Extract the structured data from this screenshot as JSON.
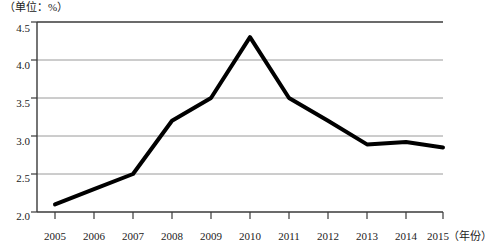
{
  "chart_data": {
    "type": "line",
    "title": "",
    "unit_note": "（单位：%）",
    "xlabel": "（年份）",
    "ylabel": "",
    "categories": [
      "2005",
      "2006",
      "2007",
      "2008",
      "2009",
      "2010",
      "2011",
      "2012",
      "2013",
      "2014",
      "2015"
    ],
    "values": [
      2.1,
      2.3,
      2.5,
      3.2,
      3.5,
      4.3,
      3.5,
      3.2,
      2.89,
      2.92,
      2.85
    ],
    "series": [
      {
        "name": "",
        "values": [
          2.1,
          2.3,
          2.5,
          3.2,
          3.5,
          4.3,
          3.5,
          3.2,
          2.89,
          2.92,
          2.85
        ]
      }
    ],
    "ylim": [
      2.0,
      4.5
    ],
    "yticks": [
      "2.0",
      "2.5",
      "3.0",
      "3.5",
      "4.0",
      "4.5"
    ],
    "ytick_values": [
      2.0,
      2.5,
      3.0,
      3.5,
      4.0,
      4.5
    ],
    "xlim_labels": [
      "2005",
      "2015"
    ],
    "grid": true,
    "grid_color": "#9a9a9a",
    "legend": "none",
    "line_color": "#000000",
    "line_width": 4,
    "axis_color": "#3a3a3a",
    "background": "#ffffff"
  },
  "axes": {
    "y_tick_labels": [
      "4.5",
      "4.0",
      "3.5",
      "3.0",
      "2.5",
      "2.0"
    ],
    "x_tick_labels": [
      "2005",
      "2006",
      "2007",
      "2008",
      "2009",
      "2010",
      "2011",
      "2012",
      "2013",
      "2014",
      "2015"
    ],
    "x_axis_unit": "（年份）",
    "y_axis_unit": "（单位：%）"
  }
}
